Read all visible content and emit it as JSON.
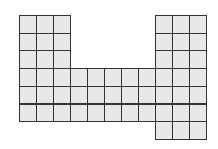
{
  "figure": {
    "colors": {
      "fill": "#e8e8e8",
      "line": "#333333",
      "background": "#ffffff"
    },
    "grid": {
      "origin_x": 19,
      "origin_y": 15,
      "cell_w": 17,
      "cell_h": 17.7,
      "columns": 11,
      "rows": 7
    },
    "regions": [
      {
        "name": "left-column-block",
        "col_start": 0,
        "col_end": 2,
        "row_start": 0,
        "row_end": 5
      },
      {
        "name": "middle-bottom-block",
        "col_start": 3,
        "col_end": 7,
        "row_start": 3,
        "row_end": 5
      },
      {
        "name": "right-column-block",
        "col_start": 8,
        "col_end": 10,
        "row_start": 0,
        "row_end": 6
      }
    ],
    "total_squares": 54
  }
}
